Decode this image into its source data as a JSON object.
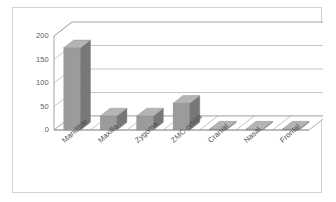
{
  "chart_data": {
    "type": "bar",
    "title": "",
    "subtitle": "",
    "xlabel": "",
    "ylabel": "",
    "categories": [
      "Mandible",
      "Maxilla",
      "Zygoma",
      "ZMC-orbita",
      "Cranial",
      "Nasal",
      "Frontal"
    ],
    "values": [
      175,
      30,
      30,
      57,
      2,
      2,
      2
    ],
    "ylim": [
      0,
      200
    ],
    "yticks": [
      0,
      50,
      100,
      150,
      200
    ],
    "ytick_labels": [
      "0",
      "50",
      "100",
      "150",
      "200"
    ],
    "grid": true,
    "grid_axis": "y",
    "legend": false,
    "legend_position": "none",
    "style": "3d-column",
    "series": [
      {
        "name": "Fracture site count",
        "values": [
          175,
          30,
          30,
          57,
          2,
          2,
          2
        ]
      }
    ],
    "colors": {
      "bar_front": "#9b9b9b",
      "bar_side": "#777777",
      "bar_top": "#b4b4b4",
      "gridline": "#b8b8b8",
      "axis": "#999999",
      "tick_label": "#5d5d5d",
      "category_label": "#4a4a4a",
      "plot_background": "#ffffff",
      "frame_border": "#d2d2d2"
    }
  }
}
